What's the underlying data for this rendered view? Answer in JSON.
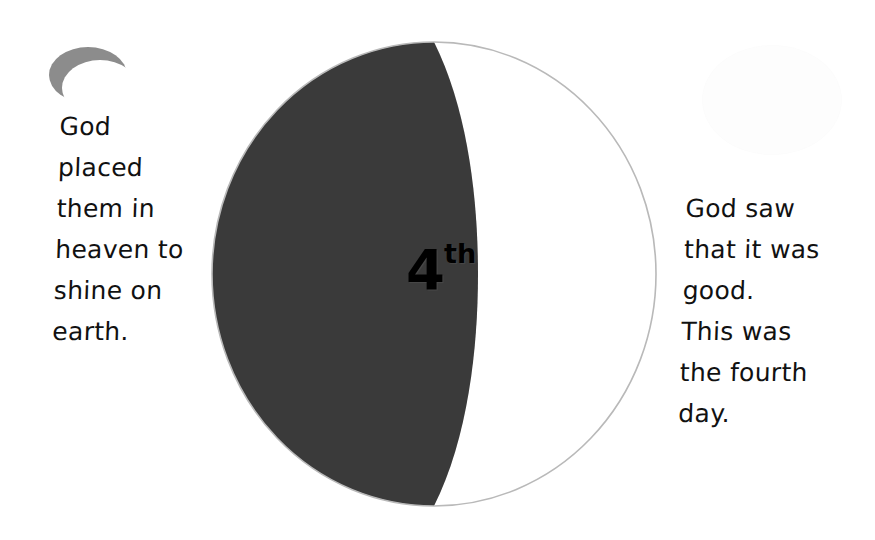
{
  "slide": {
    "width": 875,
    "height": 540,
    "background_color": "#ffffff",
    "title": "Fourth Day of Creation"
  },
  "sphere": {
    "label_number": "4",
    "label_ordinal_suffix": "th",
    "shadow_color": "#3a3a3a",
    "lit_color": "#ffffff",
    "terminator_sliver_color": "#ececec",
    "outline_color": "#b9b9b9"
  },
  "decorations": {
    "moon": {
      "name": "crescent-moon",
      "color": "#8c8c8c"
    },
    "sun": {
      "name": "faint-sun-circle",
      "color": "#fdfdfd"
    }
  },
  "captions": {
    "left": "God\nplaced\nthem in\nheaven to\nshine on\nearth.",
    "right": "God saw\nthat it was\ngood.\nThis was\nthe fourth\nday."
  }
}
